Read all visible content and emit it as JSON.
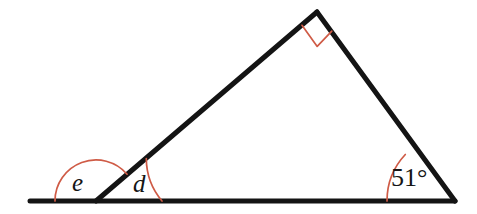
{
  "figure": {
    "type": "geometry-diagram",
    "background_color": "#ffffff",
    "line_color": "#141414",
    "mark_color": "#cf5b46",
    "canvas": {
      "width": 477,
      "height": 214
    },
    "points": {
      "baseline_left_end": {
        "x": 30,
        "y": 201
      },
      "left_vertex": {
        "x": 96,
        "y": 201
      },
      "apex": {
        "x": 317,
        "y": 12
      },
      "right_vertex": {
        "x": 455,
        "y": 201
      }
    },
    "segments": [
      {
        "name": "baseline",
        "from": "baseline_left_end",
        "to": "right_vertex"
      },
      {
        "name": "left-side",
        "from": "left_vertex",
        "to": "apex"
      },
      {
        "name": "right-side",
        "from": "apex",
        "to": "right_vertex"
      }
    ],
    "angles": [
      {
        "id": "e",
        "label": "e",
        "kind": "variable",
        "vertex": "left_vertex",
        "position": "exterior-left",
        "arc_radius": 41,
        "label_x": 80,
        "label_y": 183
      },
      {
        "id": "d",
        "label": "d",
        "kind": "variable",
        "vertex": "left_vertex",
        "position": "interior-base-left",
        "arc_radius": 66,
        "label_x": 141,
        "label_y": 184
      },
      {
        "id": "right-angle",
        "label": "",
        "kind": "right-angle-square",
        "vertex": "apex",
        "position": "interior-apex",
        "marker_size": 22
      },
      {
        "id": "angle-51",
        "label": "51°",
        "kind": "measured",
        "value": 51,
        "unit": "degrees",
        "vertex": "right_vertex",
        "position": "interior-base-right",
        "arc_radius": 68,
        "label_x": 415,
        "label_y": 179
      }
    ]
  }
}
